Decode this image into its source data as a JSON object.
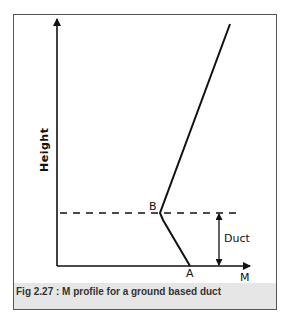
{
  "figure": {
    "caption": "Fig 2.27 : M profile for a ground based duct",
    "y_axis_label": "Height",
    "x_axis_label": "M",
    "point_a_label": "A",
    "point_b_label": "B",
    "duct_label": "Duct"
  },
  "colors": {
    "line": "#111111",
    "frame": "#555555",
    "caption_bg": "#e6e6e6"
  }
}
